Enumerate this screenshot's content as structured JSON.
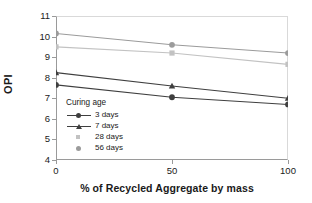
{
  "chart_data": {
    "type": "line",
    "title": "",
    "xlabel": "% of Recycled Aggregate by mass",
    "ylabel": "OPI",
    "x": [
      0,
      50,
      100
    ],
    "xticklabels": [
      "0",
      "50",
      "100"
    ],
    "xlim": [
      0,
      100
    ],
    "ylim": [
      4,
      11
    ],
    "yticks": [
      4,
      5,
      6,
      7,
      8,
      9,
      10,
      11
    ],
    "yticklabels": [
      "4",
      "5",
      "6",
      "7",
      "8",
      "9",
      "10",
      "11"
    ],
    "grid": false,
    "legend_position": "inside-lower-left",
    "legend_title": "Curing age",
    "series": [
      {
        "name": "3 days",
        "values": [
          7.65,
          7.05,
          6.7
        ],
        "color": "#3f3f3f",
        "marker": "circle"
      },
      {
        "name": "7 days",
        "values": [
          8.25,
          7.6,
          7.0
        ],
        "color": "#3f3f3f",
        "marker": "triangle"
      },
      {
        "name": "28 days",
        "values": [
          9.5,
          9.2,
          8.65
        ],
        "color": "#c2c2c2",
        "marker": "square"
      },
      {
        "name": "56 days",
        "values": [
          10.15,
          9.6,
          9.2
        ],
        "color": "#9b9b9b",
        "marker": "circle"
      }
    ]
  },
  "axes": {
    "y_title": "OPI",
    "x_title": "% of Recycled Aggregate by mass"
  },
  "legend": {
    "title": "Curing age",
    "items": [
      {
        "label": "3 days"
      },
      {
        "label": "7 days"
      },
      {
        "label": "28 days"
      },
      {
        "label": "56 days"
      }
    ]
  }
}
